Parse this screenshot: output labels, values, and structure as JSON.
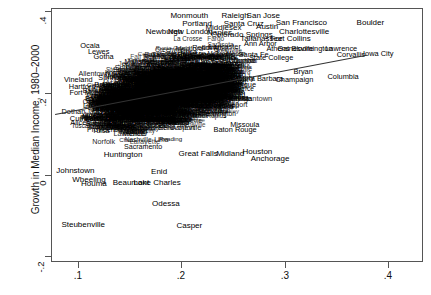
{
  "chart_data": {
    "type": "scatter",
    "title": "",
    "xlabel": "",
    "ylabel": "Growth in Median Income, 1980–2000",
    "xlim": [
      0.055,
      0.435
    ],
    "ylim": [
      -0.22,
      0.41
    ],
    "xticks": [
      ".1",
      ".2",
      ".3",
      ".4"
    ],
    "xtick_values": [
      0.1,
      0.2,
      0.3,
      0.4
    ],
    "yticks": [
      ".4",
      ".2",
      "0",
      "-.2"
    ],
    "ytick_values": [
      0.4,
      0.2,
      0.0,
      -0.2
    ],
    "grid": false,
    "legend": null,
    "point_labels": true,
    "fit_line": {
      "x0": 0.058,
      "y0": 0.148,
      "x1": 0.378,
      "y1": 0.296
    },
    "labeled_points": [
      {
        "label": "Monmouth",
        "x": 0.196,
        "y": 0.392
      },
      {
        "label": "Raleigh",
        "x": 0.243,
        "y": 0.393
      },
      {
        "label": "San Jose",
        "x": 0.272,
        "y": 0.393
      },
      {
        "label": "San Francisco",
        "x": 0.311,
        "y": 0.375
      },
      {
        "label": "Boulder",
        "x": 0.382,
        "y": 0.374
      },
      {
        "label": "Portland",
        "x": 0.204,
        "y": 0.372
      },
      {
        "label": "Santa Cruz",
        "x": 0.252,
        "y": 0.372
      },
      {
        "label": "Austin",
        "x": 0.276,
        "y": 0.364
      },
      {
        "label": "Middlesex",
        "x": 0.231,
        "y": 0.362
      },
      {
        "label": "Charlottesville",
        "x": 0.314,
        "y": 0.353
      },
      {
        "label": "Newburgh",
        "x": 0.17,
        "y": 0.352
      },
      {
        "label": "New London",
        "x": 0.197,
        "y": 0.352
      },
      {
        "label": "Naples",
        "x": 0.227,
        "y": 0.35
      },
      {
        "label": "Colorado Springs",
        "x": 0.25,
        "y": 0.345
      },
      {
        "label": "Tallahassee",
        "x": 0.27,
        "y": 0.336
      },
      {
        "label": "Fort Collins",
        "x": 0.3,
        "y": 0.336
      },
      {
        "label": "Ocala",
        "x": 0.094,
        "y": 0.317
      },
      {
        "label": "Ann Arbor",
        "x": 0.269,
        "y": 0.323
      },
      {
        "label": "Lewes",
        "x": 0.103,
        "y": 0.303
      },
      {
        "label": "Gotha",
        "x": 0.108,
        "y": 0.291
      },
      {
        "label": "Athens",
        "x": 0.287,
        "y": 0.31
      },
      {
        "label": "Gainesville",
        "x": 0.305,
        "y": 0.31
      },
      {
        "label": "Bloomington",
        "x": 0.322,
        "y": 0.31
      },
      {
        "label": "Lawrence",
        "x": 0.352,
        "y": 0.31
      },
      {
        "label": "Corvallis",
        "x": 0.362,
        "y": 0.296
      },
      {
        "label": "Iowa City",
        "x": 0.39,
        "y": 0.297
      },
      {
        "label": "Minneapolis",
        "x": 0.222,
        "y": 0.296
      },
      {
        "label": "Santa Fe",
        "x": 0.262,
        "y": 0.296
      },
      {
        "label": "State College",
        "x": 0.28,
        "y": 0.287
      },
      {
        "label": "Vineland",
        "x": 0.082,
        "y": 0.233
      },
      {
        "label": "Bryan",
        "x": 0.313,
        "y": 0.252
      },
      {
        "label": "Columbia",
        "x": 0.354,
        "y": 0.24
      },
      {
        "label": "Champaign",
        "x": 0.304,
        "y": 0.233
      },
      {
        "label": "Yolo",
        "x": 0.247,
        "y": 0.244
      },
      {
        "label": "Santa Barbara",
        "x": 0.268,
        "y": 0.236
      },
      {
        "label": "Orange County",
        "x": 0.237,
        "y": 0.238
      },
      {
        "label": "Albuquerque",
        "x": 0.243,
        "y": 0.22
      },
      {
        "label": "Hartford",
        "x": 0.086,
        "y": 0.216
      },
      {
        "label": "Fort Myers",
        "x": 0.091,
        "y": 0.2
      },
      {
        "label": "Dothan",
        "x": 0.077,
        "y": 0.152
      },
      {
        "label": "Lima",
        "x": 0.095,
        "y": 0.167
      },
      {
        "label": "Cumberland",
        "x": 0.094,
        "y": 0.136
      },
      {
        "label": "Alice",
        "x": 0.082,
        "y": 0.124
      },
      {
        "label": "Missoula",
        "x": 0.253,
        "y": 0.12
      },
      {
        "label": "Baton Rouge",
        "x": 0.243,
        "y": 0.108
      },
      {
        "label": "Great Falls",
        "x": 0.205,
        "y": 0.048
      },
      {
        "label": "Midland",
        "x": 0.238,
        "y": 0.048
      },
      {
        "label": "Houston",
        "x": 0.266,
        "y": 0.052
      },
      {
        "label": "Anchorage",
        "x": 0.279,
        "y": 0.036
      },
      {
        "label": "Huntington",
        "x": 0.128,
        "y": 0.046
      },
      {
        "label": "Johnstown",
        "x": 0.079,
        "y": 0.005
      },
      {
        "label": "Enid",
        "x": 0.165,
        "y": 0.003
      },
      {
        "label": "Wheeling",
        "x": 0.093,
        "y": -0.018
      },
      {
        "label": "Houma",
        "x": 0.098,
        "y": -0.028
      },
      {
        "label": "Beaumont",
        "x": 0.136,
        "y": -0.026
      },
      {
        "label": "Lake Charles",
        "x": 0.163,
        "y": -0.026
      },
      {
        "label": "Odessa",
        "x": 0.172,
        "y": -0.078
      },
      {
        "label": "Steubenville",
        "x": 0.087,
        "y": -0.13
      },
      {
        "label": "Casper",
        "x": 0.196,
        "y": -0.133
      }
    ],
    "dense_cluster_note": "Dense unreadable mass of overlapping city labels between x=0.09 and x=0.26, y=0.05 to 0.33"
  },
  "axes": {
    "y_title": "Growth in Median Income, 1980–2000"
  }
}
